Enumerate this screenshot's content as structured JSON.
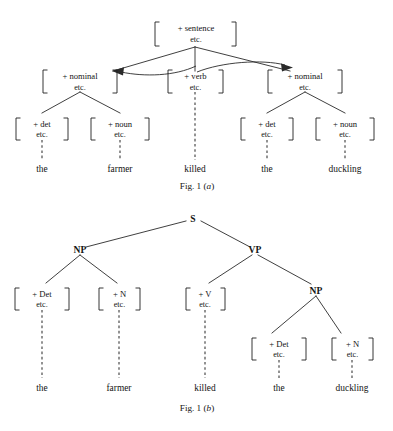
{
  "figure": {
    "panels": [
      {
        "id": "panel-a",
        "caption_prefix": "Fig. 1 (",
        "caption_letter": "a",
        "caption_suffix": ")",
        "nodes": {
          "root": {
            "line1": "+ sentence",
            "line2": "etc."
          },
          "nominal_left": {
            "line1": "+ nominal",
            "line2": "etc."
          },
          "verb": {
            "line1": "+ verb",
            "line2": "etc."
          },
          "nominal_right": {
            "line1": "+ nominal",
            "line2": "etc."
          },
          "det_left": {
            "line1": "+ det",
            "line2": "etc."
          },
          "noun_left": {
            "line1": "+ noun",
            "line2": "etc."
          },
          "det_right": {
            "line1": "+ det",
            "line2": "etc."
          },
          "noun_right": {
            "line1": "+ noun",
            "line2": "etc."
          }
        },
        "terminals": [
          "the",
          "farmer",
          "killed",
          "the",
          "duckling"
        ]
      },
      {
        "id": "panel-b",
        "caption_prefix": "Fig. 1 (",
        "caption_letter": "b",
        "caption_suffix": ")",
        "nodes": {
          "s": "S",
          "np_subject": "NP",
          "vp": "VP",
          "np_object": "NP",
          "det_subject": {
            "line1": "+ Det",
            "line2": "etc."
          },
          "n_subject": {
            "line1": "+ N",
            "line2": "etc."
          },
          "v": {
            "line1": "+ V",
            "line2": "etc."
          },
          "det_object": {
            "line1": "+ Det",
            "line2": "etc."
          },
          "n_object": {
            "line1": "+ N",
            "line2": "etc."
          }
        },
        "terminals": [
          "the",
          "farmer",
          "killed",
          "the",
          "duckling"
        ]
      }
    ]
  },
  "style": {
    "ink": "#141414",
    "line": "#2a2a2a",
    "paper": "#ffffff"
  }
}
